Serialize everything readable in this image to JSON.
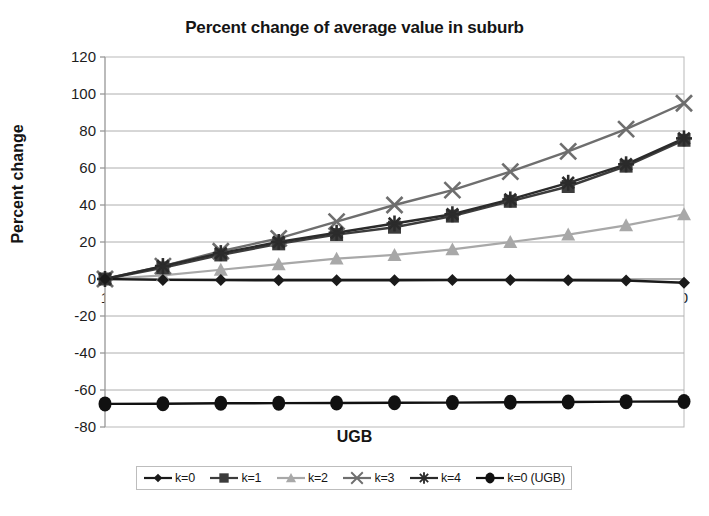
{
  "chart_data": {
    "type": "line",
    "title": "Percent change of average value in suburb",
    "xlabel": "UGB",
    "ylabel": "Percent change",
    "grid": true,
    "legend_position": "bottom",
    "x": [
      1,
      0.9,
      0.8,
      0.7,
      0.6,
      0.5,
      0.4,
      0.3,
      0.2,
      0.1,
      0
    ],
    "xtick_labels": [
      "1",
      "0.9",
      "0.8",
      "0.7",
      "0.6",
      "0.5",
      "0.4",
      "0.3",
      "0.2",
      "0.1",
      "0"
    ],
    "ytick_labels": [
      "120",
      "100",
      "80",
      "60",
      "40",
      "20",
      "0",
      "-20",
      "-40",
      "-60",
      "-80"
    ],
    "yticks": [
      120,
      100,
      80,
      60,
      40,
      20,
      0,
      -20,
      -40,
      -60,
      -80
    ],
    "ylim": [
      -80,
      120
    ],
    "series": [
      {
        "name": "k=0",
        "marker": "diamond",
        "color": "#1a1a1a",
        "values": [
          0,
          -0.5,
          -0.6,
          -0.7,
          -0.7,
          -0.7,
          -0.6,
          -0.6,
          -0.7,
          -0.8,
          -2.0
        ]
      },
      {
        "name": "k=1",
        "marker": "square",
        "color": "#3c3c3c",
        "values": [
          0,
          6,
          13,
          19,
          24,
          28,
          34,
          42,
          50,
          61,
          75
        ]
      },
      {
        "name": "k=2",
        "marker": "triangle",
        "color": "#a8a8a8",
        "values": [
          0,
          2,
          5,
          8,
          11,
          13,
          16,
          20,
          24,
          29,
          35
        ]
      },
      {
        "name": "k=3",
        "marker": "cross-x",
        "color": "#6e6e6e",
        "values": [
          0,
          7,
          15,
          22,
          31,
          40,
          48,
          58,
          69,
          81,
          95
        ]
      },
      {
        "name": "k=4",
        "marker": "asterisk",
        "color": "#2b2b2b",
        "values": [
          0,
          7,
          14,
          20,
          25,
          30,
          35,
          43,
          52,
          62,
          76
        ]
      },
      {
        "name": "k=0 (UGB)",
        "marker": "circle",
        "color": "#111111",
        "values": [
          -67.5,
          -67.4,
          -67.2,
          -67.1,
          -67.0,
          -66.9,
          -66.8,
          -66.6,
          -66.5,
          -66.3,
          -66.2
        ]
      }
    ]
  },
  "legend": {
    "items": [
      {
        "label": "k=0",
        "marker": "diamond",
        "color": "#1a1a1a"
      },
      {
        "label": "k=1",
        "marker": "square",
        "color": "#3c3c3c"
      },
      {
        "label": "k=2",
        "marker": "triangle",
        "color": "#a8a8a8"
      },
      {
        "label": "k=3",
        "marker": "cross-x",
        "color": "#6e6e6e"
      },
      {
        "label": "k=4",
        "marker": "asterisk",
        "color": "#2b2b2b"
      },
      {
        "label": "k=0 (UGB)",
        "marker": "circle",
        "color": "#111111"
      }
    ]
  },
  "bottom_text": "partially visible cut-off line of body text"
}
